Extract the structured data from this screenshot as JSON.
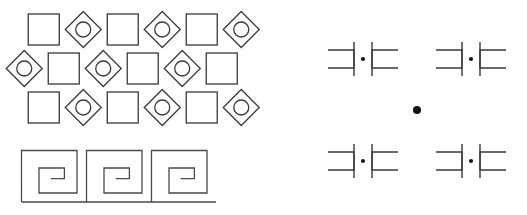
{
  "canvas": {
    "width": 527,
    "height": 215,
    "background_color": "#ffffff",
    "stroke_color": "#3a3a3a",
    "dot_color": "#111111"
  },
  "left_panel": {
    "name": "square-diamond-grid",
    "origin_x": 24,
    "origin_y": 10,
    "rows": 3,
    "columns": 6,
    "cell_width": 39.5,
    "row_height": 39,
    "row_offset_x": 19.5,
    "square": {
      "size": 31,
      "has_circle": false
    },
    "diamond": {
      "size": 36,
      "has_circle": true,
      "circle_radius": 7.5
    },
    "grid": [
      [
        "square",
        "diamond",
        "square",
        "diamond",
        "square",
        "diamond"
      ],
      [
        "diamond",
        "square",
        "diamond",
        "square",
        "diamond",
        "square"
      ],
      [
        "square",
        "diamond",
        "square",
        "diamond",
        "square",
        "diamond"
      ]
    ],
    "row_offsets": [
      0,
      -19.5,
      0
    ]
  },
  "meander_band": {
    "name": "greek-key-meander",
    "origin_x": 21,
    "origin_y": 150,
    "unit_width": 65,
    "unit_height": 52,
    "repeat_count": 3,
    "inset": 9,
    "baseline_y": 202
  },
  "right_panel": {
    "name": "corner-bracket-cross-grid",
    "center_x": 417,
    "center_y": 110,
    "module_spacing_x": 108,
    "module_spacing_y": 102,
    "bracket_arm_length": 26,
    "bracket_gap": 9,
    "modules": [
      {
        "id": "module-top-left",
        "cx": 363,
        "cy": 59
      },
      {
        "id": "module-top-right",
        "cx": 471,
        "cy": 59
      },
      {
        "id": "module-bottom-left",
        "cx": 363,
        "cy": 161
      },
      {
        "id": "module-bottom-right",
        "cx": 471,
        "cy": 161
      }
    ],
    "module_dot_radius": 2.1,
    "center_dot": {
      "id": "center-dot",
      "cx": 417,
      "cy": 110,
      "radius": 4.0
    }
  }
}
